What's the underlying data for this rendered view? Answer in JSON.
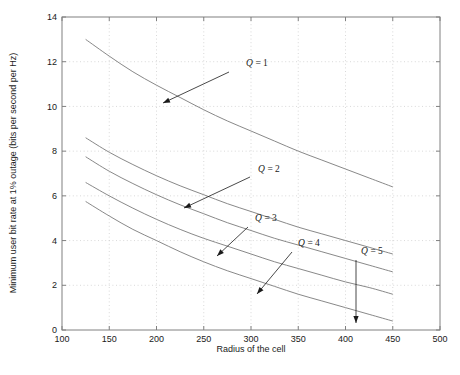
{
  "chart_data": {
    "type": "line",
    "title": "",
    "xlabel": "Radius of the cell",
    "ylabel": "Minimum user bit rate at 1% outage (bits per second per Hz)",
    "xlim": [
      100,
      500
    ],
    "ylim": [
      0,
      14
    ],
    "xticks": [
      100,
      150,
      200,
      250,
      300,
      350,
      400,
      450,
      500
    ],
    "xtick_labels": [
      "100",
      "150",
      "200",
      "250",
      "300",
      "350",
      "400",
      "450",
      "500"
    ],
    "yticks": [
      0,
      2,
      4,
      6,
      8,
      10,
      12,
      14
    ],
    "ytick_labels": [
      "0",
      "2",
      "4",
      "6",
      "8",
      "10",
      "12",
      "14"
    ],
    "grid": true,
    "grid_style": "dotted",
    "legend": "none",
    "line_color": "#7a7a7a",
    "axis_color": "#808080",
    "text_color": "#1a1a1a",
    "x": [
      125,
      150,
      175,
      200,
      225,
      250,
      275,
      300,
      325,
      350,
      375,
      400,
      425,
      450
    ],
    "series": [
      {
        "name": "Q = 1",
        "values": [
          13.0,
          12.25,
          11.55,
          10.95,
          10.4,
          9.85,
          9.35,
          8.9,
          8.45,
          8.0,
          7.6,
          7.2,
          6.8,
          6.4
        ]
      },
      {
        "name": "Q = 2",
        "values": [
          8.6,
          7.95,
          7.4,
          6.9,
          6.45,
          6.05,
          5.65,
          5.3,
          4.95,
          4.6,
          4.3,
          4.0,
          3.7,
          3.4
        ]
      },
      {
        "name": "Q = 3",
        "values": [
          7.75,
          7.1,
          6.55,
          6.05,
          5.6,
          5.2,
          4.8,
          4.45,
          4.1,
          3.8,
          3.5,
          3.2,
          2.9,
          2.6
        ]
      },
      {
        "name": "Q = 4",
        "values": [
          6.6,
          6.0,
          5.45,
          4.95,
          4.5,
          4.1,
          3.75,
          3.4,
          3.05,
          2.75,
          2.45,
          2.15,
          1.9,
          1.6
        ]
      },
      {
        "name": "Q = 5",
        "values": [
          5.75,
          5.1,
          4.5,
          4.0,
          3.5,
          3.05,
          2.65,
          2.3,
          1.95,
          1.6,
          1.3,
          1.0,
          0.7,
          0.4
        ]
      }
    ],
    "annotations": [
      {
        "label": "Q = 1",
        "label_x": 246,
        "label_y": 66,
        "arrow_from_x": 229,
        "arrow_from_y": 72,
        "arrow_to_x": 163,
        "arrow_to_y": 103
      },
      {
        "label": "Q = 2",
        "label_x": 258,
        "label_y": 172,
        "arrow_from_x": 250,
        "arrow_from_y": 177,
        "arrow_to_x": 184,
        "arrow_to_y": 208
      },
      {
        "label": "Q = 3",
        "label_x": 255,
        "label_y": 221,
        "arrow_from_x": 248,
        "arrow_from_y": 227,
        "arrow_to_x": 217,
        "arrow_to_y": 256
      },
      {
        "label": "Q = 4",
        "label_x": 298,
        "label_y": 246,
        "arrow_from_x": 292,
        "arrow_from_y": 252,
        "arrow_to_x": 257,
        "arrow_to_y": 294
      },
      {
        "label": "Q = 5",
        "label_x": 361,
        "label_y": 254,
        "arrow_from_x": 356,
        "arrow_from_y": 260,
        "arrow_to_x": 356,
        "arrow_to_y": 323
      }
    ]
  },
  "plot_geometry": {
    "left": 62,
    "right": 440,
    "top": 17,
    "bottom": 330
  }
}
